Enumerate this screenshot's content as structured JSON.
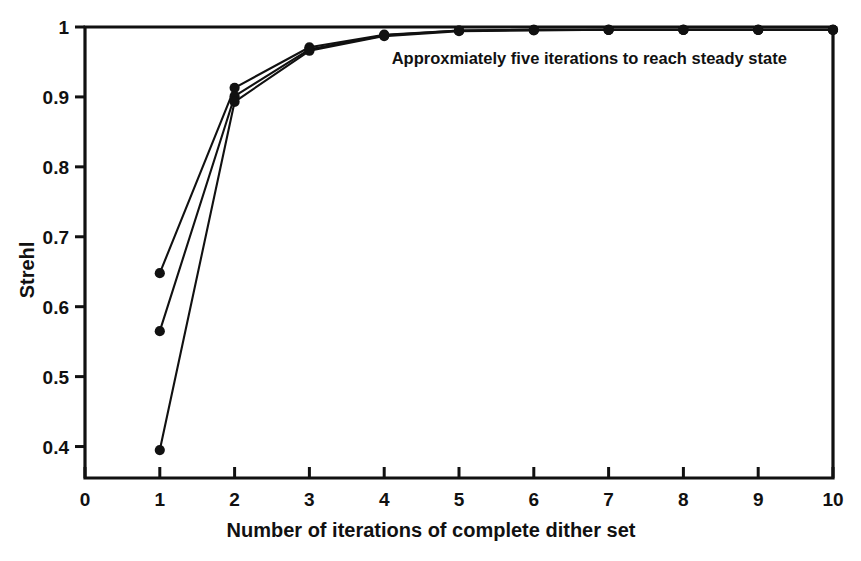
{
  "chart_data": {
    "type": "line",
    "title": "",
    "xlabel": "Number of iterations of complete dither set",
    "ylabel": "Strehl",
    "xlim": [
      0,
      10
    ],
    "ylim": [
      0.355,
      1.0
    ],
    "grid": false,
    "legend_position": "none",
    "x_ticks": [
      "0",
      "1",
      "2",
      "3",
      "4",
      "5",
      "6",
      "7",
      "8",
      "9",
      "10"
    ],
    "x_tick_values": [
      0,
      1,
      2,
      3,
      4,
      5,
      6,
      7,
      8,
      9,
      10
    ],
    "y_ticks": [
      "0.4",
      "0.5",
      "0.6",
      "0.7",
      "0.8",
      "0.9",
      "1"
    ],
    "y_tick_values": [
      0.4,
      0.5,
      0.6,
      0.7,
      0.8,
      0.9,
      1.0
    ],
    "x": [
      1,
      2,
      3,
      4,
      5,
      6,
      7,
      8,
      9,
      10
    ],
    "series": [
      {
        "name": "run-1",
        "values": [
          0.648,
          0.913,
          0.971,
          0.989,
          0.995,
          0.996,
          0.996,
          0.996,
          0.996,
          0.996
        ]
      },
      {
        "name": "run-2",
        "values": [
          0.565,
          0.901,
          0.968,
          0.988,
          0.995,
          0.996,
          0.996,
          0.996,
          0.996,
          0.996
        ]
      },
      {
        "name": "run-3",
        "values": [
          0.395,
          0.893,
          0.966,
          0.987,
          0.994,
          0.995,
          0.996,
          0.996,
          0.996,
          0.996
        ]
      }
    ],
    "annotations": [
      {
        "text": "Approxmiately five iterations to reach steady state",
        "x": 4.1,
        "y": 0.947
      }
    ],
    "marker": "filled-circle",
    "line_color": "#111111",
    "marker_color": "#111111",
    "background_color": "#ffffff"
  }
}
